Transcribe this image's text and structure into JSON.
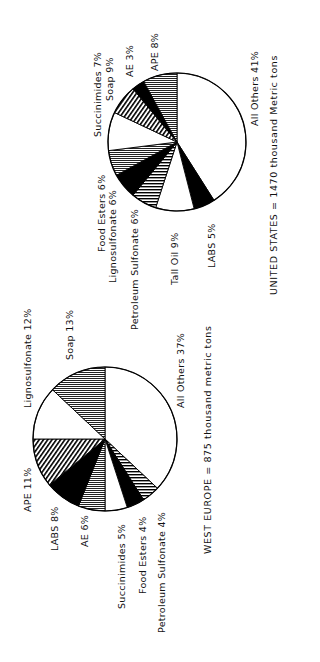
{
  "chart_data": [
    {
      "type": "pie",
      "title": "UNITED STATES = 1470 thousand Metric tons",
      "total": 1470,
      "unit": "thousand metric tons",
      "start": "top",
      "direction": "clockwise",
      "center": [
        177,
        142
      ],
      "radius": 69,
      "slices": [
        {
          "label": "All Others",
          "value": 41,
          "pattern": "white"
        },
        {
          "label": "LABS",
          "value": 5,
          "pattern": "black"
        },
        {
          "label": "Tall Oil",
          "value": 9,
          "pattern": "white"
        },
        {
          "label": "Petroleum Sulfonate",
          "value": 6,
          "pattern": "hstripe"
        },
        {
          "label": "Lignosulfonate",
          "value": 6,
          "pattern": "black"
        },
        {
          "label": "Food Esters",
          "value": 6,
          "pattern": "gray"
        },
        {
          "label": "Soap",
          "value": 9,
          "pattern": "white"
        },
        {
          "label": "Succinimides",
          "value": 7,
          "pattern": "diag"
        },
        {
          "label": "AE",
          "value": 3,
          "pattern": "black"
        },
        {
          "label": "APE",
          "value": 8,
          "pattern": "gray"
        }
      ]
    },
    {
      "type": "pie",
      "title": "WEST EUROPE = 875 thousand metric tons",
      "total": 875,
      "unit": "thousand metric tons",
      "start": "top",
      "direction": "clockwise",
      "center": [
        105,
        439
      ],
      "radius": 72,
      "slices": [
        {
          "label": "All Others",
          "value": 37,
          "pattern": "white"
        },
        {
          "label": "Petroleum Sulfonate",
          "value": 4,
          "pattern": "hstripe"
        },
        {
          "label": "Food Esters",
          "value": 4,
          "pattern": "black"
        },
        {
          "label": "Succinimides",
          "value": 5,
          "pattern": "white"
        },
        {
          "label": "AE",
          "value": 6,
          "pattern": "gray"
        },
        {
          "label": "LABS",
          "value": 8,
          "pattern": "black"
        },
        {
          "label": "APE",
          "value": 11,
          "pattern": "diag"
        },
        {
          "label": "Lignosulfonate",
          "value": 12,
          "pattern": "white"
        },
        {
          "label": "Soap",
          "value": 13,
          "pattern": "gray"
        }
      ]
    }
  ],
  "us": {
    "caption": "UNITED STATES = 1470 thousand Metric tons",
    "labels": {
      "succinimides": "Succinimides  7%",
      "soap": "Soap  9%",
      "ae": "AE  3%",
      "ape": "APE  8%",
      "all_others": "All Others  41%",
      "food_esters": "Food  Esters  6%",
      "lignosulfonate": "Lignosulfonate   6%",
      "petroleum_sulfonate": "Petroleum  Sulfonate  6%",
      "tall_oil": "Tall  Oil  9%",
      "labs": "LABS  5%"
    }
  },
  "we": {
    "caption": "WEST EUROPE = 875 thousand metric tons",
    "labels": {
      "lignosulfonate": "Lignosulfonate  12%",
      "soap": "Soap  13%",
      "all_others": "All Others  37%",
      "ape": "APE  11%",
      "labs": "LABS  8%",
      "ae": "AE  6%",
      "succinimides": "Succinimides  5%",
      "food_esters": "Food  Esters  4%",
      "petroleum_sulfonate": "Petroleum  Sulfonate  4%"
    }
  }
}
